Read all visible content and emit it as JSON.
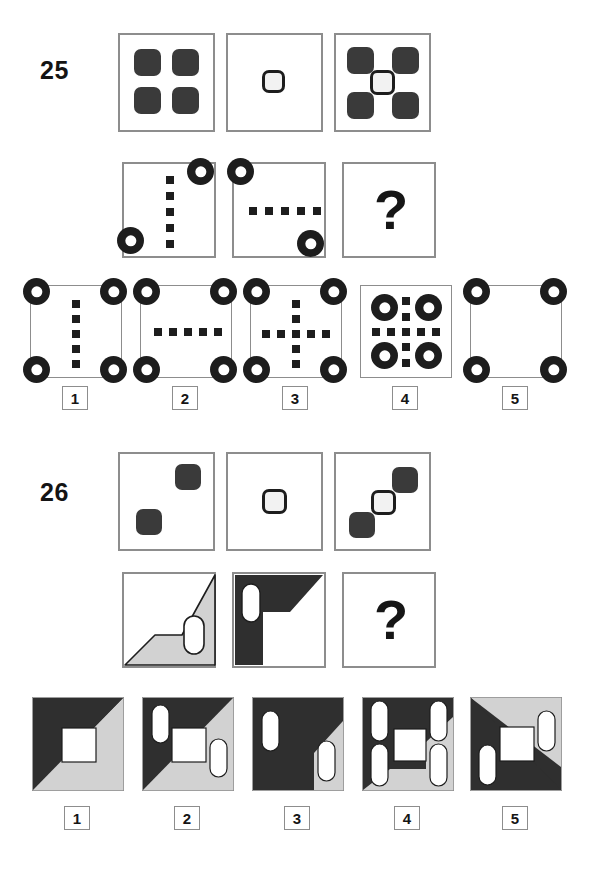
{
  "page": {
    "type": "non-verbal reasoning matrix test page",
    "background": "#ffffff",
    "colors": {
      "dark": "#3a3a3a",
      "ink": "#1d1d1d",
      "grey_fill": "#cccccc",
      "panel_border": "#8d8d8d",
      "white": "#ffffff"
    }
  },
  "questions": [
    {
      "number": "25",
      "question_mark": "?",
      "row1": [
        {
          "name": "four-dark-rounded-squares"
        },
        {
          "name": "single-open-rounded-square-center"
        },
        {
          "name": "four-dark-rounded-squares-with-open-center"
        }
      ],
      "row2": [
        {
          "name": "vertical-dotted-line-with-two-rings"
        },
        {
          "name": "horizontal-dotted-line-with-two-rings"
        },
        {
          "name": "missing-answer"
        }
      ],
      "options": [
        {
          "label": "1",
          "name": "vertical-dots-four-corner-rings"
        },
        {
          "label": "2",
          "name": "horizontal-dots-four-corner-rings"
        },
        {
          "label": "3",
          "name": "cross-dots-four-corner-rings"
        },
        {
          "label": "4",
          "name": "cross-dots-four-inset-rings"
        },
        {
          "label": "5",
          "name": "four-corner-rings-no-dots"
        }
      ]
    },
    {
      "number": "26",
      "question_mark": "?",
      "row1": [
        {
          "name": "two-diagonal-dark-rounded-squares"
        },
        {
          "name": "single-open-rounded-square-center"
        },
        {
          "name": "two-dark-squares-with-open-center-diagonal"
        }
      ],
      "row2": [
        {
          "name": "grey-zigzag-with-one-capsule"
        },
        {
          "name": "dark-zigzag-with-one-capsule"
        },
        {
          "name": "missing-answer"
        }
      ],
      "options": [
        {
          "label": "1",
          "name": "diagonal-split-white-square-no-capsules"
        },
        {
          "label": "2",
          "name": "diagonal-split-two-capsules"
        },
        {
          "label": "3",
          "name": "diagonal-split-two-capsules-variant"
        },
        {
          "label": "4",
          "name": "diagonal-split-four-capsules"
        },
        {
          "label": "5",
          "name": "inverted-diagonal-split-two-capsules"
        }
      ]
    }
  ]
}
